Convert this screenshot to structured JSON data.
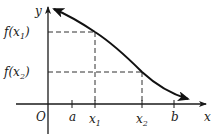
{
  "figure": {
    "axes": {
      "x_label": "x",
      "y_label": "y",
      "origin_label": "O"
    },
    "x_ticks": [
      {
        "id": "a",
        "main": "a",
        "sub": ""
      },
      {
        "id": "x1",
        "main": "x",
        "sub": "1"
      },
      {
        "id": "x2",
        "main": "x",
        "sub": "2"
      },
      {
        "id": "b",
        "main": "b",
        "sub": ""
      }
    ],
    "y_ticks": [
      {
        "id": "fx1",
        "prefix": "f(x",
        "sub": "1",
        "suffix": ")"
      },
      {
        "id": "fx2",
        "prefix": "f(x",
        "sub": "2",
        "suffix": ")"
      }
    ],
    "curve": {
      "behavior": "decreasing",
      "arrows": "both-ends"
    }
  }
}
